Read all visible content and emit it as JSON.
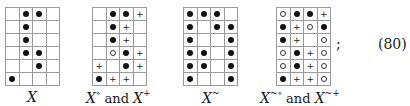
{
  "legend": {
    "dot": "filled-dot",
    "ring": "open-circle",
    "plus": "plus",
    "empty": "empty"
  },
  "figures": [
    {
      "label": {
        "var": "X",
        "sup": "",
        "and": "",
        "var2": "",
        "sup2": ""
      },
      "rows": [
        [
          "",
          "dot",
          "dot",
          ""
        ],
        [
          "",
          "dot",
          "",
          ""
        ],
        [
          "",
          "dot",
          "",
          ""
        ],
        [
          "",
          "dot",
          "dot",
          ""
        ],
        [
          "",
          "",
          "dot",
          ""
        ],
        [
          "dot",
          "",
          "",
          ""
        ]
      ]
    },
    {
      "label": {
        "var": "X",
        "sup": "∘",
        "and": " and ",
        "var2": "X",
        "sup2": "+"
      },
      "rows": [
        [
          "",
          "dot",
          "dot",
          "plus"
        ],
        [
          "",
          "dot",
          "plus",
          ""
        ],
        [
          "",
          "dot",
          "plus",
          ""
        ],
        [
          "",
          "ring",
          "dot",
          "plus"
        ],
        [
          "plus",
          "",
          "dot",
          "plus"
        ],
        [
          "dot",
          "plus",
          "plus",
          ""
        ]
      ]
    },
    {
      "label": {
        "var": "X",
        "sup": "~",
        "and": "",
        "var2": "",
        "sup2": ""
      },
      "rows": [
        [
          "dot",
          "dot",
          "dot",
          ""
        ],
        [
          "dot",
          "",
          "dot",
          "dot"
        ],
        [
          "dot",
          "",
          "",
          "dot"
        ],
        [
          "dot",
          "dot",
          "",
          "dot"
        ],
        [
          "dot",
          "dot",
          "",
          "dot"
        ],
        [
          "dot",
          "",
          "",
          "dot"
        ]
      ]
    },
    {
      "label": {
        "var": "X",
        "sup": "~∘",
        "and": " and ",
        "var2": "X",
        "sup2": "~+"
      },
      "rows": [
        [
          "ring",
          "dot",
          "dot",
          "plus"
        ],
        [
          "dot",
          "plus",
          "ring",
          "dot"
        ],
        [
          "dot",
          "plus",
          "",
          "ring"
        ],
        [
          "ring",
          "dot",
          "plus",
          "ring"
        ],
        [
          "ring",
          "dot",
          "plus",
          "ring"
        ],
        [
          "dot",
          "plus",
          "plus",
          "ring"
        ]
      ]
    }
  ],
  "punctuation": ";",
  "equation_number": "(80)"
}
